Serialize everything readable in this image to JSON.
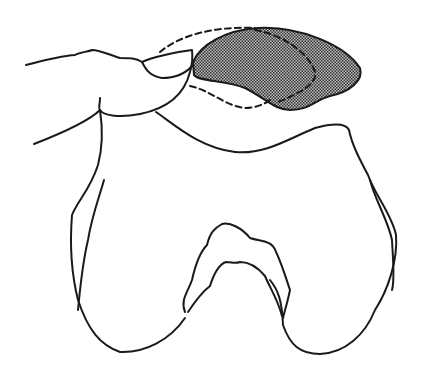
{
  "figure": {
    "elements": [
      {
        "name": "finger",
        "style": "solid outline"
      },
      {
        "name": "patella-original-position",
        "style": "dashed outline"
      },
      {
        "name": "patella-displaced",
        "style": "stippled fill",
        "fill": "#8a8a8a"
      },
      {
        "name": "femur-distal-end",
        "style": "solid outline"
      },
      {
        "name": "intercondylar-notch",
        "style": "solid outline"
      }
    ],
    "colors": {
      "line": "#1a1a1a",
      "stipple": "#8a8a8a",
      "background": "#ffffff"
    }
  }
}
